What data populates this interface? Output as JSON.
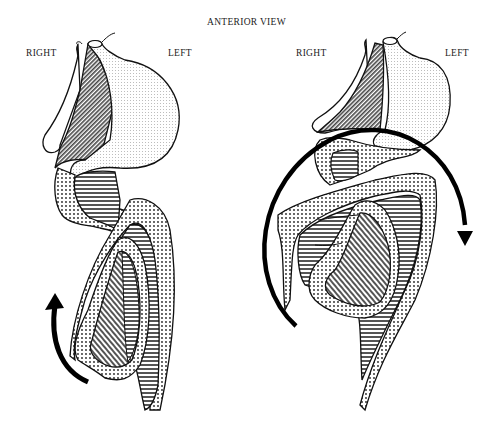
{
  "title": "ANTERIOR VIEW",
  "panels": [
    {
      "id": "left-panel",
      "label_right": "RIGHT",
      "label_left": "LEFT",
      "arrow": "curved arrow, counterclockwise, lower left"
    },
    {
      "id": "right-panel",
      "label_right": "RIGHT",
      "label_left": "LEFT",
      "arrow": "large circular arrow, clockwise, encircling bowel"
    }
  ],
  "colors": {
    "stroke": "#111111",
    "background": "#ffffff",
    "stipple": "#555555"
  }
}
